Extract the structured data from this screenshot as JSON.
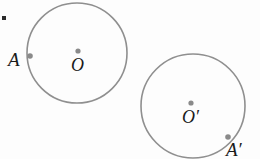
{
  "figure": {
    "background_color": "#fdfdfd",
    "stroke_color": "#8f8f8f",
    "dot_color": "#8a8a8a",
    "label_color": "#1a1a1a",
    "corner_mark_color": "#2b2b2b",
    "labels": {
      "point_a": "A",
      "center_o": "O",
      "center_o_prime": "O′",
      "point_a_prime": "A′"
    },
    "circles": [
      {
        "name": "circle-O",
        "center_label": "O",
        "cx": 77,
        "cy": 53,
        "r": 50,
        "stroke_width": 1.6
      },
      {
        "name": "circle-O-prime",
        "center_label": "O′",
        "cx": 193,
        "cy": 106,
        "r": 52,
        "stroke_width": 1.6
      }
    ],
    "points": [
      {
        "name": "center-dot-O",
        "label": "O",
        "cx": 78,
        "cy": 51,
        "r": 2.6
      },
      {
        "name": "point-dot-A",
        "label": "A",
        "cx": 30,
        "cy": 56,
        "r": 2.8
      },
      {
        "name": "center-dot-O-prime",
        "label": "O′",
        "cx": 191,
        "cy": 103,
        "r": 2.6
      },
      {
        "name": "point-dot-A-prime",
        "label": "A′",
        "cx": 228,
        "cy": 137,
        "r": 2.8
      }
    ]
  }
}
